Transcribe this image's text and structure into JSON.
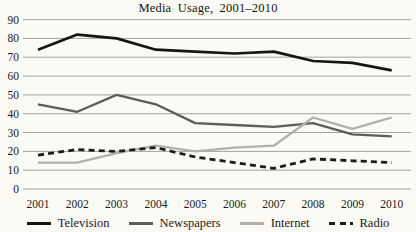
{
  "title": "Media Usage, 2001–2010",
  "chart_data": {
    "type": "line",
    "title": "Media Usage, 2001–2010",
    "xlabel": "",
    "ylabel": "",
    "categories": [
      "2001",
      "2002",
      "2003",
      "2004",
      "2005",
      "2006",
      "2007",
      "2008",
      "2009",
      "2010"
    ],
    "series": [
      {
        "name": "Television",
        "color": "#161616",
        "style": "solid",
        "stroke_width": 2.7,
        "values": [
          74,
          82,
          80,
          74,
          73,
          72,
          73,
          68,
          67,
          63
        ]
      },
      {
        "name": "Newspapers",
        "color": "#5d5d5d",
        "style": "solid",
        "stroke_width": 2.3,
        "values": [
          45,
          41,
          50,
          45,
          35,
          34,
          33,
          35,
          29,
          28
        ]
      },
      {
        "name": "Internet",
        "color": "#b1b1ab",
        "style": "solid",
        "stroke_width": 2.3,
        "values": [
          14,
          14,
          19,
          23,
          20,
          22,
          23,
          38,
          32,
          38
        ]
      },
      {
        "name": "Radio",
        "color": "#1c1c1c",
        "style": "dashed",
        "stroke_width": 2.8,
        "values": [
          18,
          21,
          20,
          22,
          17,
          14,
          11,
          16,
          15,
          14
        ]
      }
    ],
    "y_ticks": [
      0,
      10,
      20,
      30,
      40,
      50,
      60,
      70,
      80,
      90
    ],
    "ylim": [
      0,
      90
    ],
    "grid": "horizontal",
    "gridline_color": "#a3a29b",
    "legend_position": "bottom"
  }
}
